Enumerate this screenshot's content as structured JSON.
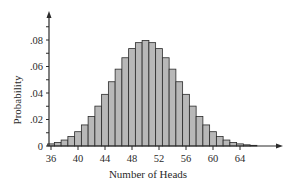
{
  "chart_data": {
    "type": "bar",
    "title": "",
    "xlabel": "Number of Heads",
    "ylabel": "Probability",
    "categories": [
      36,
      37,
      38,
      39,
      40,
      41,
      42,
      43,
      44,
      45,
      46,
      47,
      48,
      49,
      50,
      51,
      52,
      53,
      54,
      55,
      56,
      57,
      58,
      59,
      60,
      61,
      62,
      63,
      64,
      65,
      66
    ],
    "values": [
      0.0016,
      0.0027,
      0.0045,
      0.0071,
      0.0108,
      0.0159,
      0.0223,
      0.0301,
      0.039,
      0.0485,
      0.058,
      0.0666,
      0.0735,
      0.078,
      0.0796,
      0.078,
      0.0735,
      0.0666,
      0.058,
      0.0485,
      0.039,
      0.0301,
      0.0223,
      0.0159,
      0.0108,
      0.0071,
      0.0045,
      0.0027,
      0.0016,
      0.0009,
      0.0005
    ],
    "x_ticks": [
      "36",
      "40",
      "44",
      "48",
      "52",
      "56",
      "60",
      "64"
    ],
    "y_ticks": [
      "0",
      ".02",
      ".04",
      ".06",
      ".08"
    ],
    "ylim": [
      0,
      0.09
    ],
    "grid": false,
    "legend": "none",
    "bar_color": "#b8b8b8",
    "edge_color": "#2a2a2a"
  }
}
